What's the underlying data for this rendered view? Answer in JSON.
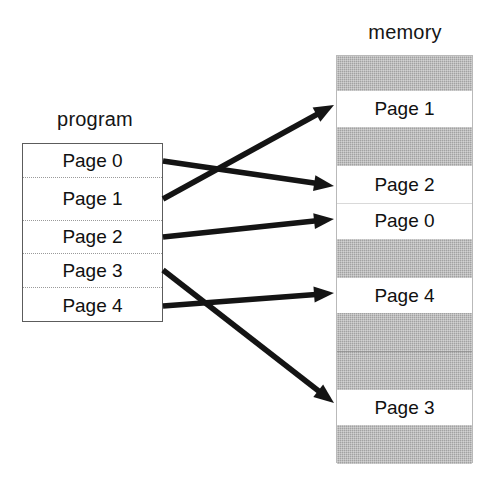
{
  "diagram": {
    "program": {
      "caption": "program",
      "box": {
        "x": 22,
        "y": 143,
        "w": 141,
        "h": 179
      },
      "rows": [
        {
          "label": "Page 0",
          "y": 143,
          "h": 34
        },
        {
          "label": "Page 1",
          "y": 177,
          "h": 43
        },
        {
          "label": "Page 2",
          "y": 220,
          "h": 33
        },
        {
          "label": "Page 3",
          "y": 253,
          "h": 34
        },
        {
          "label": "Page 4",
          "y": 287,
          "h": 35
        }
      ]
    },
    "memory": {
      "caption": "memory",
      "box": {
        "x": 336,
        "y": 55,
        "w": 137,
        "h": 408
      },
      "slots": [
        {
          "label": "",
          "state": "free",
          "y": 55,
          "h": 35
        },
        {
          "label": "Page 1",
          "state": "used",
          "y": 90,
          "h": 36
        },
        {
          "label": "",
          "state": "free",
          "y": 126,
          "h": 39
        },
        {
          "label": "Page 2",
          "state": "used",
          "y": 165,
          "h": 37
        },
        {
          "label": "Page 0",
          "state": "used",
          "y": 202,
          "h": 36
        },
        {
          "label": "",
          "state": "free",
          "y": 238,
          "h": 39
        },
        {
          "label": "Page 4",
          "state": "used",
          "y": 277,
          "h": 35
        },
        {
          "label": "",
          "state": "free",
          "y": 312,
          "h": 38
        },
        {
          "label": "",
          "state": "free",
          "y": 350,
          "h": 39
        },
        {
          "label": "Page 3",
          "state": "used",
          "y": 389,
          "h": 35
        },
        {
          "label": "",
          "state": "free",
          "y": 424,
          "h": 39
        }
      ],
      "dividers": [
        202
      ],
      "hairlines": [
        350
      ]
    },
    "mappings": [
      {
        "from": "Page 0",
        "to": "Page 2",
        "x1": 163,
        "y1": 161,
        "x2": 334,
        "y2": 186
      },
      {
        "from": "Page 1",
        "to": "Page 1",
        "x1": 163,
        "y1": 199,
        "x2": 334,
        "y2": 105
      },
      {
        "from": "Page 2",
        "to": "Page 0",
        "x1": 163,
        "y1": 237,
        "x2": 334,
        "y2": 219
      },
      {
        "from": "Page 3",
        "to": "Page 3",
        "x1": 163,
        "y1": 270,
        "x2": 334,
        "y2": 403
      },
      {
        "from": "Page 4",
        "to": "Page 4",
        "x1": 163,
        "y1": 306,
        "x2": 334,
        "y2": 293
      }
    ],
    "colors": {
      "free_frame": "#a2a2a2",
      "used_frame": "#ffffff",
      "arrow": "#141414",
      "text": "#101010",
      "box_border": "#5c5c5c",
      "background": "#ffffff"
    }
  }
}
